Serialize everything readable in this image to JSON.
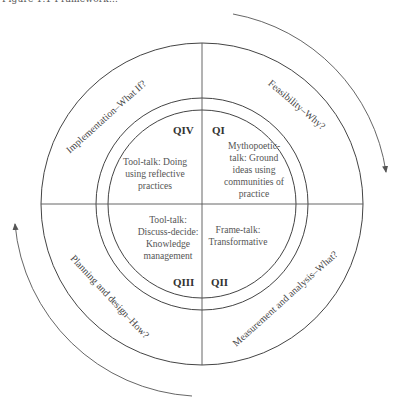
{
  "caption": "Figure 1.1 Framework...",
  "diagram": {
    "center": [
      202,
      204
    ],
    "radii": {
      "outer": 161,
      "middle": 106,
      "inner": 94,
      "arrows": 189
    },
    "stroke_color": "#444444",
    "arrow_color": "#555555"
  },
  "quadrants": {
    "q1": {
      "label": "QI",
      "lines": [
        "Mythopoetic-",
        "talk: Ground",
        "ideas using",
        "communities of",
        "practice"
      ]
    },
    "q2": {
      "label": "QII",
      "lines": [
        "Frame-talk:",
        "Transformative"
      ]
    },
    "q3": {
      "label": "QIII",
      "lines": [
        "Tool-talk:",
        "Discuss-decide:",
        "Knowledge",
        "management"
      ]
    },
    "q4": {
      "label": "QIV",
      "lines": [
        "Tool-talk: Doing",
        "using reflective",
        "practices"
      ]
    }
  },
  "ring_labels": {
    "top_left": "Implementation–What If?",
    "top_right": "Feasibility–Why?",
    "bottom_left": "Planning and design–How?",
    "bottom_right": "Measurement and analysis–What?"
  },
  "arrows": [
    {
      "name": "clockwise-arrow-top-right",
      "direction": "clockwise"
    },
    {
      "name": "clockwise-arrow-bottom-left",
      "direction": "clockwise"
    }
  ]
}
